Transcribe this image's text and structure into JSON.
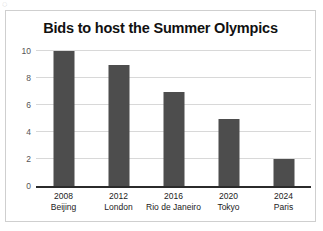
{
  "chart_data": {
    "type": "bar",
    "title": "Bids to host the Summer Olympics",
    "xlabel": "",
    "ylabel": "",
    "categories": [
      "2008\nBeijing",
      "2012\nLondon",
      "2016\nRio de Janeiro",
      "2020\nTokyo",
      "2024\nParis"
    ],
    "category_years": [
      "2008",
      "2012",
      "2016",
      "2020",
      "2024"
    ],
    "category_cities": [
      "Beijing",
      "London",
      "Rio de Janeiro",
      "Tokyo",
      "Paris"
    ],
    "values": [
      10,
      9,
      7,
      5,
      2
    ],
    "ylim": [
      0,
      10
    ],
    "ytick_labels": [
      "0",
      "2",
      "4",
      "6",
      "8",
      "10"
    ],
    "ytick_values": [
      0,
      2,
      4,
      6,
      8,
      10
    ],
    "grid": true,
    "legend": false,
    "bar_color": "#4d4d4d",
    "gridline_color": "#d8d8d8",
    "axis_color": "#2b2b2b",
    "frame_color": "#cfcfcf",
    "background_color": "#ffffff"
  },
  "figure": {
    "corner_mark": "◌"
  }
}
